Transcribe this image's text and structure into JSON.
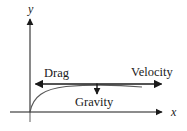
{
  "figure": {
    "type": "force-diagram",
    "background_color": "#ffffff",
    "stroke_color": "#1a1a1a",
    "curve_color": "#555555",
    "axis_below_color": "#999999"
  },
  "axes": {
    "y_label": "y",
    "x_label": "x",
    "origin": {
      "x": 30,
      "y": 112
    },
    "x_axis": {
      "start_x": 10,
      "end_x": 164,
      "y": 112,
      "arrow": "right"
    },
    "y_axis": {
      "x": 30,
      "start_y": 122,
      "end_y": 18,
      "arrow": "up"
    }
  },
  "curve": {
    "name": "trajectory",
    "start": {
      "x": 30,
      "y": 112
    },
    "end": {
      "x": 142,
      "y": 86
    },
    "shape": "concave-down rising then flattening"
  },
  "vectors": [
    {
      "name": "drag",
      "label": "Drag",
      "direction": "left",
      "line_y": 84,
      "from_x": 97,
      "to_x": 34,
      "label_x": 44,
      "label_y": 67
    },
    {
      "name": "velocity",
      "label": "Velocity",
      "direction": "right",
      "line_y": 84,
      "from_x": 97,
      "to_x": 163,
      "label_x": 131,
      "label_y": 66
    },
    {
      "name": "gravity",
      "label": "Gravity",
      "direction": "down",
      "line_x": 97,
      "from_y": 84,
      "to_y": 95,
      "label_x": 75,
      "label_y": 96
    }
  ]
}
